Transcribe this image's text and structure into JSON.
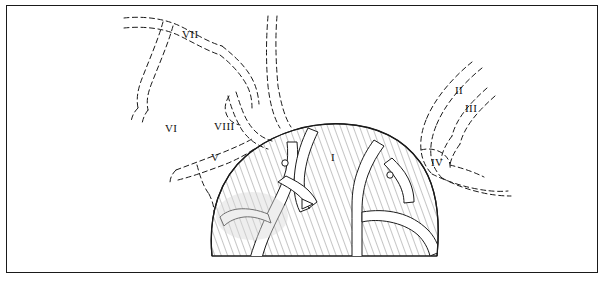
{
  "figure": {
    "title": "",
    "background_color": "#ffffff",
    "border_color": "#1a1a1a",
    "line_color": "#1a1a1a",
    "hatch_color": "#6b6b6b"
  },
  "labels": [
    {
      "id": "label-vii",
      "text": "VII",
      "x": 182,
      "y": 29
    },
    {
      "id": "label-ii",
      "text": "II",
      "x": 455,
      "y": 85
    },
    {
      "id": "label-iii",
      "text": "III",
      "x": 465,
      "y": 103
    },
    {
      "id": "label-vi",
      "text": "VI",
      "x": 165,
      "y": 123
    },
    {
      "id": "label-viii",
      "text": "VIII",
      "x": 214,
      "y": 121
    },
    {
      "id": "label-v",
      "text": "V",
      "x": 211,
      "y": 152
    },
    {
      "id": "label-i",
      "text": "I",
      "x": 331,
      "y": 152
    },
    {
      "id": "label-iv",
      "text": "IV",
      "x": 431,
      "y": 157
    }
  ],
  "markers": [
    {
      "id": "small-circle-left",
      "shape": "circle",
      "cx": 285,
      "cy": 163,
      "r": 3.2
    },
    {
      "id": "small-circle-right",
      "shape": "circle",
      "cx": 390,
      "cy": 175,
      "r": 3.2
    },
    {
      "id": "arrowhead-marker",
      "shape": "triangle",
      "cx": 307,
      "cy": 204
    }
  ]
}
